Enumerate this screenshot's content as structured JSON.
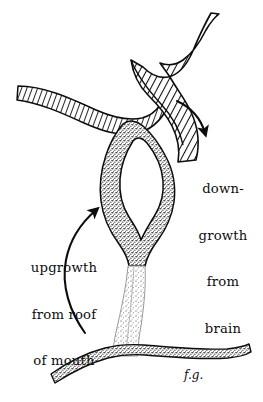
{
  "figure": {
    "background_color": "#ffffff",
    "ink_color": "#0d0d0d",
    "signature": "f.g."
  },
  "labels": {
    "downgrowth": {
      "name": "down-growth from brain",
      "lines": [
        "down-",
        "growth",
        "from",
        "brain"
      ]
    },
    "upgrowth": {
      "name": "upgrowth from roof of mouth",
      "lines": [
        "upgrowth",
        "from roof",
        "of mouth"
      ]
    }
  },
  "structures": {
    "downgrowth": {
      "label": "down-growth from brain",
      "texture": "diagonal-hatching",
      "description": "ribbon-like hatched band curving from upper right down to the centre, plus a hatched wing extending to the left"
    },
    "upgrowth": {
      "label": "upgrowth from roof of mouth",
      "texture": "stipple",
      "description": "hollow stippled pouch with a central cavity, narrowing into a stalk that joins the roof of the mouth"
    },
    "roof_of_mouth": {
      "label": "roof of mouth",
      "texture": "stipple",
      "description": "horizontal stippled band across the lower part of the drawing"
    }
  },
  "arrows": [
    {
      "name": "downgrowth-arrow",
      "points_to": "down-growth from brain",
      "direction": "curves down and to the right, head pointing down-left"
    },
    {
      "name": "upgrowth-arrow",
      "points_to": "upgrowth from roof of mouth",
      "direction": "long curve from lower left sweeping up, head pointing up-right"
    }
  ]
}
